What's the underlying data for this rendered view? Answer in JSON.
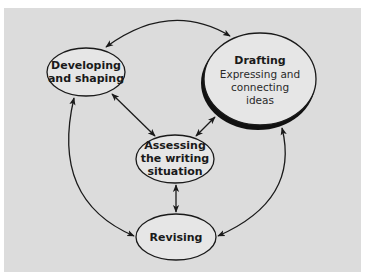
{
  "diagram": {
    "type": "writing-process-cycle",
    "background_color": "#dcdcdc",
    "nodes": [
      {
        "id": "developing",
        "title_line1": "Developing",
        "title_line2": "and shaping"
      },
      {
        "id": "drafting",
        "title": "Drafting",
        "sub_line1": "Expressing and",
        "sub_line2": "connecting",
        "sub_line3": "ideas"
      },
      {
        "id": "assessing",
        "title_line1": "Assessing",
        "title_line2": "the writing",
        "title_line3": "situation"
      },
      {
        "id": "revising",
        "title": "Revising"
      }
    ],
    "edges": [
      {
        "from": "developing",
        "to": "drafting",
        "bidirectional": true
      },
      {
        "from": "developing",
        "to": "assessing",
        "bidirectional": true
      },
      {
        "from": "drafting",
        "to": "assessing",
        "bidirectional": true
      },
      {
        "from": "assessing",
        "to": "revising",
        "bidirectional": true
      },
      {
        "from": "developing",
        "to": "revising",
        "bidirectional": true
      },
      {
        "from": "drafting",
        "to": "revising",
        "bidirectional": true
      }
    ]
  }
}
